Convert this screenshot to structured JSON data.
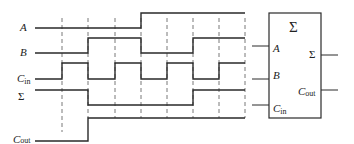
{
  "diagram": {
    "type": "timing-diagram-with-full-adder",
    "signals": [
      {
        "name": "A",
        "label": "A",
        "subscript": "",
        "levels": [
          0,
          0,
          0,
          0,
          1,
          1,
          1,
          1
        ]
      },
      {
        "name": "B",
        "label": "B",
        "subscript": "",
        "levels": [
          0,
          0,
          1,
          1,
          0,
          0,
          1,
          1
        ]
      },
      {
        "name": "Cin",
        "label": "C",
        "subscript": "in",
        "levels": [
          0,
          1,
          0,
          1,
          0,
          1,
          0,
          1
        ]
      },
      {
        "name": "Sum",
        "label": "Σ",
        "subscript": "",
        "levels": [
          0,
          1,
          1,
          0,
          1,
          0,
          0,
          1
        ]
      },
      {
        "name": "Cout",
        "label": "C",
        "subscript": "out",
        "levels": [
          0,
          0,
          0,
          1,
          0,
          1,
          1,
          1
        ]
      }
    ],
    "time_divisions": 8,
    "block": {
      "title": "Σ",
      "inputs": [
        {
          "label": "A",
          "subscript": ""
        },
        {
          "label": "B",
          "subscript": ""
        },
        {
          "label": "C",
          "subscript": "in"
        }
      ],
      "outputs": [
        {
          "label": "Σ",
          "subscript": ""
        },
        {
          "label": "C",
          "subscript": "out"
        }
      ]
    }
  }
}
